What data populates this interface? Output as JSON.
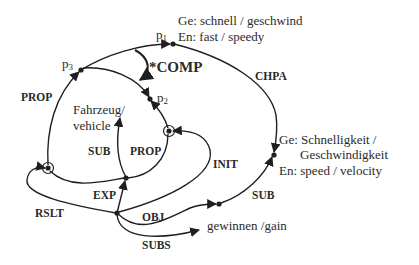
{
  "diagram": {
    "colors": {
      "stroke": "#1f1f1f",
      "text": "#2a2a2a",
      "background": "#ffffff"
    },
    "points": {
      "p1": {
        "base": "p",
        "sub": "1"
      },
      "p2": {
        "base": "p",
        "sub": "2"
      },
      "p3": {
        "base": "p",
        "sub": "3"
      }
    },
    "relations": {
      "comp": "*COMP",
      "prop_left": "PROP",
      "prop_inner": "PROP",
      "sub_inner": "SUB",
      "sub_right": "SUB",
      "chpa": "CHPA",
      "init": "INIT",
      "exp": "EXP",
      "rslt": "RSLT",
      "obj": "OBJ",
      "subs": "SUBS"
    },
    "concepts": {
      "fast": {
        "line1": "Ge: schnell / geschwind",
        "line2": "En: fast / speedy"
      },
      "speed": {
        "line1": "Ge: Schnelligkeit /",
        "line2": "Geschwindigkeit",
        "line3": "En: speed / velocity"
      },
      "vehicle": {
        "line1": "Fahrzeug/",
        "line2": "vehicle"
      },
      "gain": {
        "line1": "gewinnen /gain"
      }
    }
  }
}
